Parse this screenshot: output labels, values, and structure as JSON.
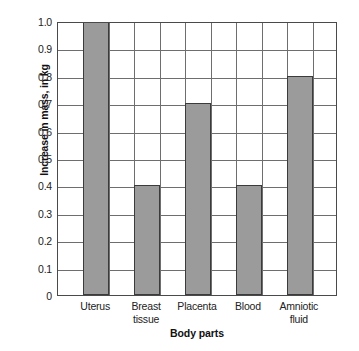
{
  "chart_data": {
    "type": "bar",
    "title": "",
    "categories": [
      "Uterus",
      "Breast tissue",
      "Placenta",
      "Blood",
      "Amniotic fluid"
    ],
    "category_lines": [
      [
        "Uterus"
      ],
      [
        "Breast",
        "tissue"
      ],
      [
        "Placenta"
      ],
      [
        "Blood"
      ],
      [
        "Amniotic",
        "fluid"
      ]
    ],
    "values": [
      1.0,
      0.4,
      0.7,
      0.4,
      0.8
    ],
    "xlabel": "Body parts",
    "ylabel": "Increase in mass, in kg",
    "ylim": [
      0,
      1.0
    ],
    "ytick_values": [
      0,
      0.1,
      0.2,
      0.3,
      0.4,
      0.5,
      0.6,
      0.7,
      0.8,
      0.9,
      1.0
    ],
    "ytick_labels": [
      "0",
      "0.1",
      "0.2",
      "0.3",
      "0.4",
      "0.5",
      "0.6",
      "0.7",
      "0.8",
      "0.9",
      "1.0"
    ],
    "ytick_interval": 0.1,
    "grid": "both",
    "legend": "none",
    "bar_fill_color": "#9b9b9b",
    "bar_edge_color": "#3b3b3b",
    "grid_color": "#6e6e6e",
    "axis_color": "#4a4a4a",
    "background_color": "#ffffff",
    "column_slots": 11,
    "bar_slot_indices": [
      1,
      3,
      5,
      7,
      9
    ]
  }
}
